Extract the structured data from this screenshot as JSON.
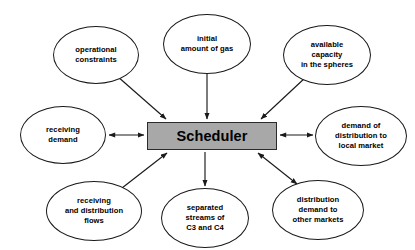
{
  "diagram": {
    "hub": {
      "label": "Scheduler",
      "fill_color": "#a8a8a8",
      "border_color": "#2b2b2b",
      "text_color": "#000000"
    },
    "style": {
      "background_color": "#ffffff",
      "node_fill": "#ffffff",
      "node_border": "#1a1a1a",
      "edge_color": "#1a1a1a"
    },
    "nodes": [
      {
        "id": "operational-constraints",
        "label": "operational\nconstraints",
        "position": "top-left",
        "x": 53,
        "y": 26,
        "width": 86,
        "height": 58
      },
      {
        "id": "initial-amount-of-gas",
        "label": "initial\namount of gas",
        "position": "top-center",
        "x": 163,
        "y": 14,
        "width": 88,
        "height": 60
      },
      {
        "id": "available-capacity-in-the-spheres",
        "label": "available\ncapacity\nin the spheres",
        "position": "top-right",
        "x": 283,
        "y": 25,
        "width": 88,
        "height": 60
      },
      {
        "id": "receiving-demand",
        "label": "receiving\ndemand",
        "position": "left",
        "x": 20,
        "y": 106,
        "width": 86,
        "height": 58
      },
      {
        "id": "demand-of-distribution-to-local-market",
        "label": "demand of\ndistribution to\nlocal market",
        "position": "right",
        "x": 315,
        "y": 106,
        "width": 92,
        "height": 60
      },
      {
        "id": "receiving-and-distribution-flows",
        "label": "receiving\nand distribution\nflows",
        "position": "bottom-left",
        "x": 46,
        "y": 181,
        "width": 96,
        "height": 60
      },
      {
        "id": "separated-streams-of-c3-and-c4",
        "label": "separated\nstreams of\nC3 and  C4",
        "position": "bottom-center",
        "x": 161,
        "y": 188,
        "width": 88,
        "height": 60
      },
      {
        "id": "distribution-demand-to-other-markets",
        "label": "distribution\ndemand to\nother markets",
        "position": "bottom-right",
        "x": 272,
        "y": 180,
        "width": 92,
        "height": 60
      }
    ],
    "edges": [
      {
        "id": "edge-operational-constraints",
        "from": "operational-constraints",
        "to": "hub",
        "direction": "to-hub",
        "arrowheads": 1
      },
      {
        "id": "edge-initial-amount-of-gas",
        "from": "initial-amount-of-gas",
        "to": "hub",
        "direction": "to-hub",
        "arrowheads": 1
      },
      {
        "id": "edge-available-capacity",
        "from": "available-capacity-in-the-spheres",
        "to": "hub",
        "direction": "to-hub",
        "arrowheads": 1
      },
      {
        "id": "edge-receiving-demand",
        "from": "receiving-demand",
        "to": "hub",
        "direction": "bidirectional",
        "arrowheads": 2
      },
      {
        "id": "edge-demand-of-distribution",
        "from": "hub",
        "to": "demand-of-distribution-to-local-market",
        "direction": "bidirectional",
        "arrowheads": 2
      },
      {
        "id": "edge-receiving-and-distribution-flows",
        "from": "receiving-and-distribution-flows",
        "to": "hub",
        "direction": "to-hub",
        "arrowheads": 1
      },
      {
        "id": "edge-separated-streams",
        "from": "hub",
        "to": "separated-streams-of-c3-and-c4",
        "direction": "from-hub",
        "arrowheads": 1
      },
      {
        "id": "edge-distribution-demand-other-markets",
        "from": "hub",
        "to": "distribution-demand-to-other-markets",
        "direction": "bidirectional",
        "arrowheads": 2
      }
    ]
  }
}
